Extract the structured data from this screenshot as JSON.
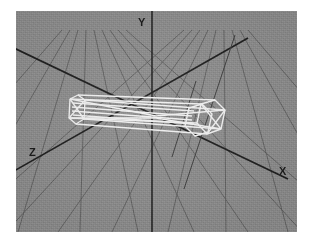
{
  "app": {
    "title": "3D Wireframe Viewport",
    "kind": "3d-modeling-viewport"
  },
  "viewport": {
    "background_color": "#8b8b8b",
    "frame_color": "#ffffff",
    "width": 281,
    "height": 221,
    "left": 16,
    "top": 11,
    "texture": "film-grain-noise"
  },
  "axes": {
    "origin": {
      "x": 152,
      "y": 115
    },
    "color": "#1d1d1d",
    "line_width": 1.6,
    "items": [
      {
        "name": "x-axis",
        "label": "X",
        "label_x": 279,
        "label_y": 166,
        "from": {
          "x": 16,
          "y": 50
        },
        "to": {
          "x": 282,
          "y": 177
        }
      },
      {
        "name": "y-axis",
        "label": "Y",
        "label_x": 138,
        "label_y": 17,
        "from": {
          "x": 152,
          "y": 11
        },
        "to": {
          "x": 152,
          "y": 232
        }
      },
      {
        "name": "z-axis",
        "label": "Z",
        "label_x": 29,
        "label_y": 147,
        "from": {
          "x": 16,
          "y": 168
        },
        "to": {
          "x": 243,
          "y": 39
        }
      }
    ]
  },
  "grid": {
    "name": "perspective-floor-grid",
    "color": "#5c5c5c",
    "line_width": 0.9,
    "horizon_y": 36,
    "vanishing_point": {
      "x": 190,
      "y": 30
    },
    "rows": 11,
    "columns": 13,
    "plane": "XZ"
  },
  "object": {
    "name": "hexagonal-prism-wireframe",
    "color": "#f2f2f2",
    "line_width": 1.4,
    "cross_section": "hexagon",
    "segments": 4,
    "axis_alignment": "Z",
    "left_cap": {
      "cx": 74,
      "cy": 110,
      "rx": 7,
      "ry": 16
    },
    "right_cap": {
      "cx": 212,
      "cy": 117,
      "rx": 10,
      "ry": 17
    },
    "near_cap": {
      "cx": 196,
      "cy": 113,
      "rx": 11,
      "ry": 18
    }
  },
  "helpers": {
    "name": "selection-cross-lines",
    "color": "#3a3a3a",
    "lines": [
      {
        "name": "helper-line-steep",
        "from": {
          "x": 232,
          "y": 36
        },
        "to": {
          "x": 186,
          "y": 186
        }
      },
      {
        "name": "helper-line-diagonal",
        "from": {
          "x": 193,
          "y": 82
        },
        "to": {
          "x": 175,
          "y": 153
        }
      }
    ]
  }
}
